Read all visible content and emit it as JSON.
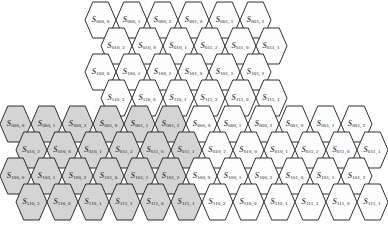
{
  "figure": {
    "type": "hexagonal-lattice-diagram",
    "symbol": "S",
    "shaded_color": "#d4d4d4",
    "unshaded_color": "#fdfdfd",
    "stroke_color": "#1a1a1a",
    "caption": ""
  },
  "geometry": {
    "hex_width": 31,
    "hex_height": 36,
    "row_step_y": 26,
    "col_step_x": 31,
    "row_offset_x": 15.5
  },
  "blocks": [
    {
      "name": "upper-block",
      "origin_x": 85,
      "origin_y": 2,
      "rows": [
        {
          "indent": 0,
          "cells": [
            {
              "label": "S",
              "sub1": "000",
              "sub2": "0",
              "shaded": false
            },
            {
              "label": "S",
              "sub1": "000",
              "sub2": "1",
              "shaded": false
            },
            {
              "label": "S",
              "sub1": "000",
              "sub2": "2",
              "shaded": false
            },
            {
              "label": "S",
              "sub1": "001",
              "sub2": "0",
              "shaded": false
            },
            {
              "label": "S",
              "sub1": "001",
              "sub2": "1",
              "shaded": false
            },
            {
              "label": "S",
              "sub1": "001",
              "sub2": "2",
              "shaded": false
            }
          ]
        },
        {
          "indent": 1,
          "cells": [
            {
              "label": "S",
              "sub1": "010",
              "sub2": "2",
              "shaded": false
            },
            {
              "label": "S",
              "sub1": "010",
              "sub2": "0",
              "shaded": false
            },
            {
              "label": "S",
              "sub1": "010",
              "sub2": "1",
              "shaded": false
            },
            {
              "label": "S",
              "sub1": "011",
              "sub2": "2",
              "shaded": false
            },
            {
              "label": "S",
              "sub1": "011",
              "sub2": "0",
              "shaded": false
            },
            {
              "label": "S",
              "sub1": "011",
              "sub2": "1",
              "shaded": false
            }
          ]
        },
        {
          "indent": 0,
          "cells": [
            {
              "label": "S",
              "sub1": "100",
              "sub2": "0",
              "shaded": false
            },
            {
              "label": "S",
              "sub1": "100",
              "sub2": "1",
              "shaded": false
            },
            {
              "label": "S",
              "sub1": "100",
              "sub2": "2",
              "shaded": false
            },
            {
              "label": "S",
              "sub1": "101",
              "sub2": "0",
              "shaded": false
            },
            {
              "label": "S",
              "sub1": "101",
              "sub2": "1",
              "shaded": false
            },
            {
              "label": "S",
              "sub1": "101",
              "sub2": "2",
              "shaded": false
            }
          ]
        },
        {
          "indent": 1,
          "cells": [
            {
              "label": "S",
              "sub1": "110",
              "sub2": "2",
              "shaded": false
            },
            {
              "label": "S",
              "sub1": "110",
              "sub2": "0",
              "shaded": false
            },
            {
              "label": "S",
              "sub1": "110",
              "sub2": "1",
              "shaded": false
            },
            {
              "label": "S",
              "sub1": "111",
              "sub2": "2",
              "shaded": false
            },
            {
              "label": "S",
              "sub1": "111",
              "sub2": "0",
              "shaded": false
            },
            {
              "label": "S",
              "sub1": "111",
              "sub2": "1",
              "shaded": false
            }
          ]
        }
      ]
    },
    {
      "name": "lower-block",
      "origin_x": 0,
      "origin_y": 106,
      "rows": [
        {
          "indent": 0,
          "cells": [
            {
              "label": "S",
              "sub1": "000",
              "sub2": "0",
              "shaded": true
            },
            {
              "label": "S",
              "sub1": "000",
              "sub2": "1",
              "shaded": true
            },
            {
              "label": "S",
              "sub1": "000",
              "sub2": "2",
              "shaded": true
            },
            {
              "label": "S",
              "sub1": "001",
              "sub2": "0",
              "shaded": true
            },
            {
              "label": "S",
              "sub1": "001",
              "sub2": "1",
              "shaded": true
            },
            {
              "label": "S",
              "sub1": "001",
              "sub2": "2",
              "shaded": true
            },
            {
              "label": "S",
              "sub1": "000",
              "sub2": "0",
              "shaded": false
            },
            {
              "label": "S",
              "sub1": "000",
              "sub2": "1",
              "shaded": false
            },
            {
              "label": "S",
              "sub1": "000",
              "sub2": "2",
              "shaded": false
            },
            {
              "label": "S",
              "sub1": "001",
              "sub2": "0",
              "shaded": false
            },
            {
              "label": "S",
              "sub1": "001",
              "sub2": "1",
              "shaded": false
            },
            {
              "label": "S",
              "sub1": "001",
              "sub2": "2",
              "shaded": false
            }
          ]
        },
        {
          "indent": 1,
          "cells": [
            {
              "label": "S",
              "sub1": "010",
              "sub2": "2",
              "shaded": true
            },
            {
              "label": "S",
              "sub1": "010",
              "sub2": "0",
              "shaded": true
            },
            {
              "label": "S",
              "sub1": "010",
              "sub2": "1",
              "shaded": true
            },
            {
              "label": "S",
              "sub1": "011",
              "sub2": "2",
              "shaded": true
            },
            {
              "label": "S",
              "sub1": "011",
              "sub2": "0",
              "shaded": true
            },
            {
              "label": "S",
              "sub1": "011",
              "sub2": "1",
              "shaded": true
            },
            {
              "label": "S",
              "sub1": "010",
              "sub2": "2",
              "shaded": false
            },
            {
              "label": "S",
              "sub1": "010",
              "sub2": "0",
              "shaded": false
            },
            {
              "label": "S",
              "sub1": "010",
              "sub2": "1",
              "shaded": false
            },
            {
              "label": "S",
              "sub1": "011",
              "sub2": "2",
              "shaded": false
            },
            {
              "label": "S",
              "sub1": "011",
              "sub2": "0",
              "shaded": false
            },
            {
              "label": "S",
              "sub1": "011",
              "sub2": "1",
              "shaded": false
            }
          ]
        },
        {
          "indent": 0,
          "cells": [
            {
              "label": "S",
              "sub1": "100",
              "sub2": "0",
              "shaded": true
            },
            {
              "label": "S",
              "sub1": "100",
              "sub2": "1",
              "shaded": true
            },
            {
              "label": "S",
              "sub1": "100",
              "sub2": "2",
              "shaded": true
            },
            {
              "label": "S",
              "sub1": "101",
              "sub2": "0",
              "shaded": true
            },
            {
              "label": "S",
              "sub1": "101",
              "sub2": "1",
              "shaded": true
            },
            {
              "label": "S",
              "sub1": "101",
              "sub2": "2",
              "shaded": true
            },
            {
              "label": "S",
              "sub1": "100",
              "sub2": "0",
              "shaded": false
            },
            {
              "label": "S",
              "sub1": "100",
              "sub2": "1",
              "shaded": false
            },
            {
              "label": "S",
              "sub1": "100",
              "sub2": "2",
              "shaded": false
            },
            {
              "label": "S",
              "sub1": "101",
              "sub2": "0",
              "shaded": false
            },
            {
              "label": "S",
              "sub1": "101",
              "sub2": "1",
              "shaded": false
            },
            {
              "label": "S",
              "sub1": "101",
              "sub2": "2",
              "shaded": false
            }
          ]
        },
        {
          "indent": 1,
          "cells": [
            {
              "label": "S",
              "sub1": "110",
              "sub2": "2",
              "shaded": true
            },
            {
              "label": "S",
              "sub1": "110",
              "sub2": "0",
              "shaded": true
            },
            {
              "label": "S",
              "sub1": "110",
              "sub2": "1",
              "shaded": true
            },
            {
              "label": "S",
              "sub1": "111",
              "sub2": "2",
              "shaded": true
            },
            {
              "label": "S",
              "sub1": "111",
              "sub2": "0",
              "shaded": true
            },
            {
              "label": "S",
              "sub1": "111",
              "sub2": "1",
              "shaded": true
            },
            {
              "label": "S",
              "sub1": "110",
              "sub2": "2",
              "shaded": false
            },
            {
              "label": "S",
              "sub1": "110",
              "sub2": "0",
              "shaded": false
            },
            {
              "label": "S",
              "sub1": "110",
              "sub2": "1",
              "shaded": false
            },
            {
              "label": "S",
              "sub1": "111",
              "sub2": "2",
              "shaded": false
            },
            {
              "label": "S",
              "sub1": "111",
              "sub2": "0",
              "shaded": false
            },
            {
              "label": "S",
              "sub1": "111",
              "sub2": "1",
              "shaded": false
            }
          ]
        }
      ]
    }
  ]
}
